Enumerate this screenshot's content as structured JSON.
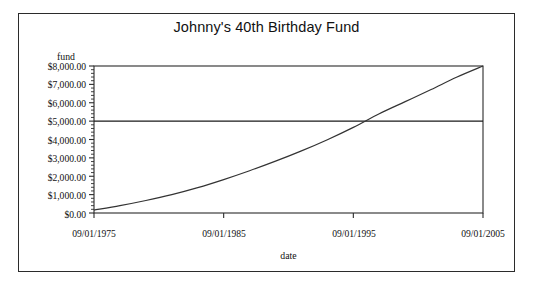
{
  "chart_data": {
    "type": "line",
    "title": "Johnny's 40th Birthday Fund",
    "xlabel": "date",
    "ylabel": "fund",
    "grid": false,
    "legend": null,
    "x_tick_labels": [
      "09/01/1975",
      "09/01/1985",
      "09/01/1995",
      "09/01/2005"
    ],
    "y_tick_labels": [
      "$8,000.00",
      "$7,000.00",
      "$6,000.00",
      "$5,000.00",
      "$4,000.00",
      "$3,000.00",
      "$2,000.00",
      "$1,000.00",
      "$0.00"
    ],
    "ylim": [
      0,
      8000
    ],
    "xlim": [
      "09/01/1975",
      "09/01/2005"
    ],
    "y_tick_values": [
      8000,
      7000,
      6000,
      5000,
      4000,
      3000,
      2000,
      1000,
      0
    ],
    "minor_y_ticks": true,
    "reference_line": {
      "name": "goal-line",
      "orientation": "horizontal",
      "value": 5000,
      "color": "#1a1a1a"
    },
    "series": [
      {
        "name": "fund",
        "color": "#333333",
        "x": [
          "09/01/1975",
          "09/01/1977",
          "09/01/1979",
          "09/01/1981",
          "09/01/1983",
          "09/01/1985",
          "09/01/1987",
          "09/01/1989",
          "09/01/1991",
          "09/01/1993",
          "09/01/1995",
          "09/01/1997",
          "09/01/1999",
          "09/01/2001",
          "09/01/2003",
          "09/01/2005"
        ],
        "values": [
          160,
          400,
          680,
          1000,
          1380,
          1820,
          2300,
          2820,
          3380,
          3990,
          4660,
          5400,
          6060,
          6720,
          7400,
          8000
        ]
      }
    ],
    "crossing_point": {
      "label": "curve crosses $5,000.00",
      "date": "09/01/1997",
      "value": 5000
    }
  },
  "axes_geometry": {
    "plot_left": 94,
    "plot_top": 66,
    "plot_right": 483,
    "plot_bottom": 213
  }
}
